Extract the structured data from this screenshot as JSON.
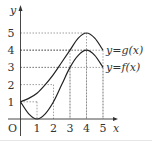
{
  "chart_data": {
    "type": "line",
    "title": "",
    "xlabel": "x",
    "ylabel": "y",
    "origin_label": "O",
    "xlim": [
      0,
      5
    ],
    "ylim": [
      0,
      5
    ],
    "x_ticks": [
      "1",
      "2",
      "3",
      "4",
      "5"
    ],
    "y_ticks": [
      "1",
      "2",
      "3",
      "4",
      "5"
    ],
    "grid": "dashed reference lines",
    "series": [
      {
        "name": "y=g(x)",
        "label": "y=g(x)",
        "x": [
          0,
          0.5,
          1,
          1.5,
          2,
          2.5,
          3,
          3.5,
          4,
          4.5,
          5
        ],
        "y": [
          1,
          1.2,
          1.5,
          2.0,
          2.6,
          3.3,
          4.0,
          4.7,
          5,
          4.7,
          4
        ]
      },
      {
        "name": "y=f(x)",
        "label": "y=f(x)",
        "x": [
          0,
          0.5,
          1,
          1.5,
          2,
          2.5,
          3,
          3.5,
          4,
          4.5,
          5
        ],
        "y": [
          1,
          0.3,
          0,
          0.3,
          1,
          2.0,
          3,
          3.7,
          4,
          3.7,
          3
        ]
      }
    ],
    "reference_points": [
      {
        "x": 1,
        "y": 1
      },
      {
        "x": 2,
        "y": 2
      },
      {
        "x": 3,
        "y": 3
      },
      {
        "x": 3,
        "y": 4
      },
      {
        "x": 4,
        "y": 4
      },
      {
        "x": 4,
        "y": 5
      },
      {
        "x": 5,
        "y": 3
      },
      {
        "x": 5,
        "y": 4
      }
    ]
  }
}
